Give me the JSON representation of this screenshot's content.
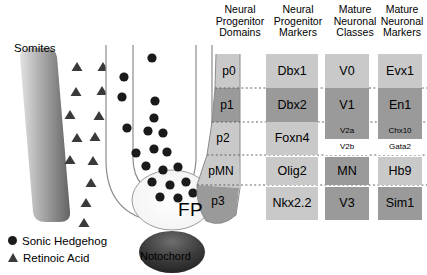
{
  "anatomy": {
    "somites_label": "Somites",
    "floorplate_label": "FP",
    "notochord_label": "Notochord"
  },
  "legend": {
    "items": [
      {
        "label": "Sonic Hedgehog",
        "glyph": "circle-icon",
        "color": "#1a1a1a"
      },
      {
        "label": "Retinoic Acid",
        "glyph": "triangle-icon",
        "color": "#3a3a3a"
      }
    ]
  },
  "columns": [
    {
      "id": "neural-progenitor-domains",
      "header_lines": [
        "Neural",
        "Progenitor",
        "Domains"
      ]
    },
    {
      "id": "neural-progenitor-markers",
      "header_lines": [
        "Neural",
        "Progenitor",
        "Markers"
      ]
    },
    {
      "id": "mature-neuronal-classes",
      "header_lines": [
        "Mature",
        "Neuronal",
        "Classes"
      ]
    },
    {
      "id": "mature-neuronal-markers",
      "header_lines": [
        "Mature",
        "Neuronal",
        "Markers"
      ]
    }
  ],
  "rows": [
    {
      "domain": "p0",
      "domain_shade": "light",
      "progenitor_marker": "Dbx1",
      "marker_shade": "light",
      "neuronal_class": "V0",
      "class_shade": "light",
      "neuronal_marker": "Evx1",
      "neuronal_marker_shade": "light"
    },
    {
      "domain": "p1",
      "domain_shade": "dark",
      "progenitor_marker": "Dbx2",
      "marker_shade": "dark",
      "neuronal_class": "V1",
      "class_shade": "dark",
      "neuronal_marker": "En1",
      "neuronal_marker_shade": "dark"
    },
    {
      "domain": "p2",
      "domain_shade": "light",
      "progenitor_marker": "Foxn4",
      "marker_shade": "light",
      "neuronal_class": "V2a",
      "class_shade": "dark",
      "neuronal_class_b": "V2b",
      "class_b_shade": "white",
      "neuronal_marker": "Chx10",
      "neuronal_marker_shade": "dark",
      "neuronal_marker_b": "Gata2",
      "neuronal_marker_b_shade": "white"
    },
    {
      "domain": "pMN",
      "domain_shade": "light",
      "progenitor_marker": "Olig2",
      "marker_shade": "light",
      "neuronal_class": "MN",
      "class_shade": "dark",
      "neuronal_marker": "Hb9",
      "neuronal_marker_shade": "light"
    },
    {
      "domain": "p3",
      "domain_shade": "dark",
      "progenitor_marker": "Nkx2.2",
      "marker_shade": "light",
      "neuronal_class": "V3",
      "class_shade": "dark",
      "neuronal_marker": "Sim1",
      "neuronal_marker_shade": "dark"
    }
  ],
  "colors": {
    "light_gray": "#c9c9c9",
    "dark_gray": "#9a9a9a",
    "shh_dot": "#1a1a1a",
    "ra_triangle": "#3a3a3a",
    "notochord": "#2a2a2a",
    "outline": "#8c8c8c"
  }
}
